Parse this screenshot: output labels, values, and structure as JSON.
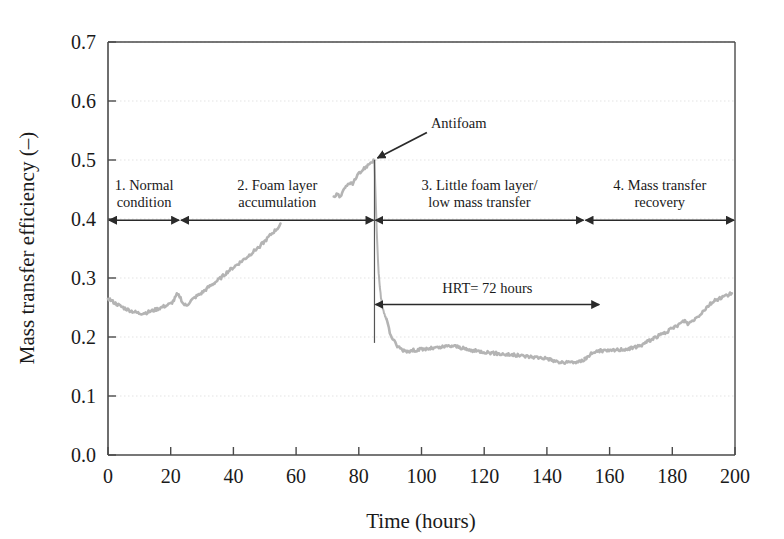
{
  "chart_data": {
    "type": "line",
    "title": "",
    "xlabel": "Time (hours)",
    "ylabel": "Mass transfer efficiency (–)",
    "xlim": [
      0,
      200
    ],
    "ylim": [
      0.0,
      0.7
    ],
    "xticks": [
      0,
      20,
      40,
      60,
      80,
      100,
      120,
      140,
      160,
      180,
      200
    ],
    "yticks": [
      "0.0",
      "0.1",
      "0.2",
      "0.3",
      "0.4",
      "0.5",
      "0.6",
      "0.7"
    ],
    "grid": "horizontal-dotted-faint",
    "legend": "none",
    "series": [
      {
        "name": "Mass transfer efficiency",
        "color": "#b4b4b4",
        "style": "noisy-line",
        "segments": [
          {
            "name": "phase-1-and-2-rise",
            "x": [
              0,
              2,
              4,
              6,
              8,
              10,
              12,
              14,
              16,
              18,
              20,
              21,
              22,
              23,
              24,
              25,
              26,
              28,
              30,
              32,
              34,
              36,
              38,
              40,
              42,
              44,
              46,
              48,
              50,
              52,
              54,
              55
            ],
            "y": [
              0.266,
              0.258,
              0.252,
              0.247,
              0.243,
              0.24,
              0.241,
              0.244,
              0.248,
              0.252,
              0.256,
              0.262,
              0.272,
              0.268,
              0.256,
              0.253,
              0.259,
              0.268,
              0.275,
              0.284,
              0.292,
              0.3,
              0.31,
              0.318,
              0.326,
              0.334,
              0.343,
              0.352,
              0.362,
              0.374,
              0.384,
              0.39
            ]
          },
          {
            "name": "phase-2-peak-rise",
            "x": [
              72,
              73,
              74,
              75,
              76,
              77,
              78,
              79,
              80,
              81,
              82,
              83,
              84,
              85
            ],
            "y": [
              0.437,
              0.443,
              0.438,
              0.446,
              0.455,
              0.462,
              0.459,
              0.468,
              0.476,
              0.482,
              0.487,
              0.492,
              0.497,
              0.5
            ]
          },
          {
            "name": "antifoam-crash",
            "x": [
              85,
              85.4,
              85.8,
              86.2,
              86.6,
              87,
              87.4,
              87.8,
              88.2,
              88.6,
              89
            ],
            "y": [
              0.5,
              0.43,
              0.37,
              0.32,
              0.29,
              0.27,
              0.255,
              0.245,
              0.238,
              0.233,
              0.228
            ]
          },
          {
            "name": "phase-3-low-plateau",
            "x": [
              89,
              90,
              92,
              94,
              96,
              98,
              100,
              102,
              104,
              106,
              108,
              110,
              112,
              114,
              116,
              118,
              120,
              124,
              128,
              132,
              136,
              140,
              142,
              144,
              146,
              148,
              150,
              152
            ],
            "y": [
              0.228,
              0.205,
              0.186,
              0.178,
              0.176,
              0.178,
              0.179,
              0.18,
              0.181,
              0.182,
              0.184,
              0.185,
              0.183,
              0.179,
              0.177,
              0.176,
              0.175,
              0.172,
              0.17,
              0.168,
              0.166,
              0.164,
              0.16,
              0.157,
              0.156,
              0.158,
              0.157,
              0.162
            ]
          },
          {
            "name": "phase-4-recovery",
            "x": [
              152,
              154,
              156,
              158,
              160,
              162,
              164,
              166,
              168,
              170,
              172,
              174,
              176,
              178,
              180,
              182,
              184,
              185,
              186,
              188,
              190,
              192,
              194,
              196,
              198,
              199
            ],
            "y": [
              0.162,
              0.172,
              0.176,
              0.177,
              0.176,
              0.178,
              0.179,
              0.18,
              0.182,
              0.186,
              0.192,
              0.198,
              0.203,
              0.208,
              0.214,
              0.221,
              0.228,
              0.222,
              0.226,
              0.234,
              0.245,
              0.256,
              0.263,
              0.268,
              0.272,
              0.274
            ]
          }
        ]
      }
    ],
    "annotations": [
      {
        "name": "antifoam",
        "label": "Antifoam",
        "points_to_x": 85,
        "points_to_y": 0.5,
        "label_x": 103,
        "label_y": 0.555
      },
      {
        "name": "hrt",
        "label": "HRT= 72 hours",
        "x_start": 85,
        "x_end": 157,
        "y": 0.255
      },
      {
        "name": "antifoam-drop-line",
        "x": 85,
        "y_top": 0.5,
        "y_bottom": 0.19
      }
    ],
    "phases": [
      {
        "number": "1",
        "label_line1": "1. Normal",
        "label_line2": "condition",
        "x_start": 0,
        "x_end": 23
      },
      {
        "number": "2",
        "label_line1": "2. Foam layer",
        "label_line2": "accumulation",
        "x_start": 23,
        "x_end": 85
      },
      {
        "number": "3",
        "label_line1": "3. Little foam layer/",
        "label_line2": "low mass transfer",
        "x_start": 85,
        "x_end": 152
      },
      {
        "number": "4",
        "label_line1": "4. Mass transfer",
        "label_line2": "recovery",
        "x_start": 152,
        "x_end": 200
      }
    ],
    "phase_bar_y": 0.398
  }
}
